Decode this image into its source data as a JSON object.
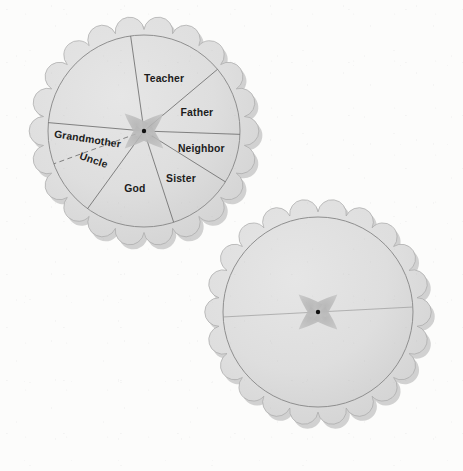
{
  "scene": {
    "title": "Two scalloped paper spinner wheels",
    "background_color": "#fcfcfb",
    "paper_fill": "#dedede",
    "paper_edge_color": "#8f8f8f",
    "shadow_color": "#b4b4b4",
    "label_color": "#1c1c1c",
    "petal_color": "#b9b9b9",
    "hub_color": "#111111"
  },
  "wheels": [
    {
      "id": "labeled-wheel",
      "name": "top-left-spinner-wheel",
      "center": {
        "x": 144,
        "y": 131
      },
      "outer_radius": 109,
      "inner_radius": 96,
      "scallop_count": 22,
      "has_labels": true,
      "segments": [
        {
          "label": "Teacher",
          "start_deg": 262,
          "end_deg": 320,
          "label_radius": 56,
          "label_angle_deg": 291,
          "rotate": 0,
          "anchor": "middle"
        },
        {
          "label": "Father",
          "start_deg": 320,
          "end_deg": 2,
          "label_radius": 56,
          "label_angle_deg": 341,
          "rotate": 0,
          "anchor": "middle"
        },
        {
          "label": "Neighbor",
          "start_deg": 2,
          "end_deg": 32,
          "label_radius": 60,
          "label_angle_deg": 17,
          "rotate": 0,
          "anchor": "middle"
        },
        {
          "label": "Sister",
          "start_deg": 32,
          "end_deg": 72,
          "label_radius": 60,
          "label_angle_deg": 52,
          "rotate": 0,
          "anchor": "middle"
        },
        {
          "label": "God",
          "start_deg": 72,
          "end_deg": 126,
          "label_radius": 58,
          "label_angle_deg": 99,
          "rotate": 0,
          "anchor": "middle"
        },
        {
          "label": "Uncle",
          "start_deg": 126,
          "end_deg": 160,
          "label_radius": 58,
          "label_angle_deg": 150,
          "rotate": 19,
          "anchor": "middle"
        },
        {
          "label": "Grandmother",
          "start_deg": 160,
          "end_deg": 185,
          "label_radius": 57,
          "label_angle_deg": 172,
          "rotate": 9,
          "anchor": "middle"
        }
      ],
      "dashed_divider_deg": 160,
      "solid_dividers_deg": [
        2,
        32,
        72,
        126,
        185,
        262,
        320
      ]
    },
    {
      "id": "blank-wheel",
      "name": "bottom-right-spinner-wheel",
      "center": {
        "x": 318,
        "y": 312
      },
      "outer_radius": 107,
      "inner_radius": 95,
      "scallop_count": 22,
      "has_labels": false,
      "segments": [],
      "diameter_line_deg": 357
    }
  ],
  "spinner_shadow": {
    "name": "four-petal-arrow-shadow",
    "petal_angles_deg": [
      42,
      138,
      222,
      318
    ],
    "petal_length": 26,
    "petal_width": 9,
    "hub_radius": 2.2
  }
}
